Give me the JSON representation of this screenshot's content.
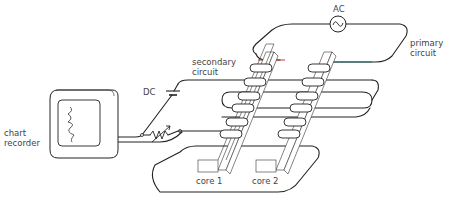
{
  "diagram": {
    "labels": {
      "ac_source": "AC",
      "primary_circuit_line1": "primary",
      "primary_circuit_line2": "circuit",
      "secondary_circuit_line1": "secondary",
      "secondary_circuit_line2": "circuit",
      "dc_source": "DC",
      "chart_recorder_line1": "chart",
      "chart_recorder_line2": "recorder",
      "core_1": "core 1",
      "core_2": "core 2"
    },
    "colors": {
      "line": "#222222",
      "primary_red": "#c0392b",
      "primary_teal": "#1f6f6a",
      "text": "#444444"
    }
  }
}
